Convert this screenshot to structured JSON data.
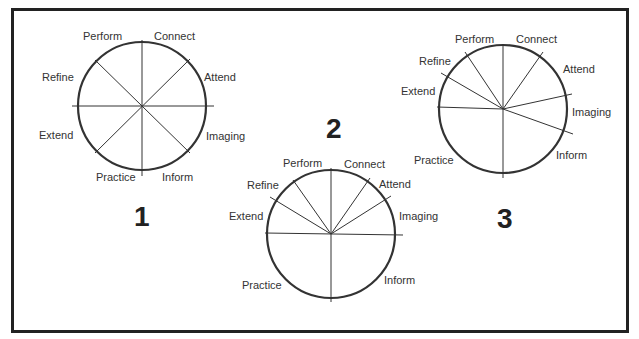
{
  "diagrams": [
    {
      "number": "1",
      "labels": {
        "perform": "Perform",
        "connect": "Connect",
        "refine": "Refine",
        "attend": "Attend",
        "extend": "Extend",
        "imaging": "Imaging",
        "practice": "Practice",
        "inform": "Inform"
      }
    },
    {
      "number": "2",
      "labels": {
        "perform": "Perform",
        "connect": "Connect",
        "refine": "Refine",
        "attend": "Attend",
        "extend": "Extend",
        "imaging": "Imaging",
        "practice": "Practice",
        "inform": "Inform"
      }
    },
    {
      "number": "3",
      "labels": {
        "perform": "Perform",
        "connect": "Connect",
        "refine": "Refine",
        "attend": "Attend",
        "extend": "Extend",
        "imaging": "Imaging",
        "practice": "Practice",
        "inform": "Inform"
      }
    }
  ],
  "colors": {
    "line": "#333333",
    "frame": "#222222",
    "text": "#333333"
  }
}
